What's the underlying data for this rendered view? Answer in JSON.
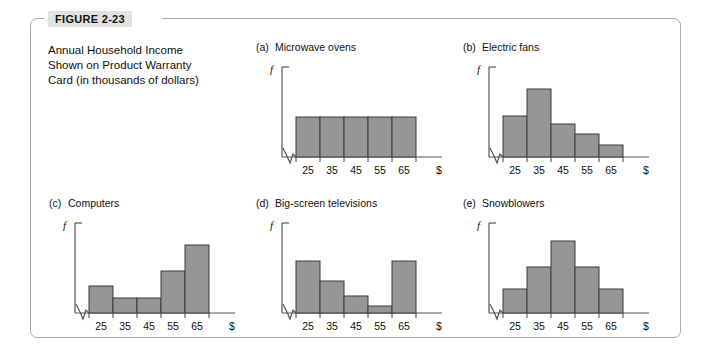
{
  "figure": {
    "tag": "FIGURE 2-23",
    "caption_lines": [
      "Annual Household Income",
      "Shown on Product Warranty",
      "Card (in thousands of dollars)"
    ]
  },
  "axis": {
    "y_label": "f",
    "x_label": "$",
    "tick_labels": [
      "25",
      "35",
      "45",
      "55",
      "65"
    ]
  },
  "colors": {
    "bar_fill": "#969696",
    "bar_stroke": "#3a3a3a",
    "axis": "#555555",
    "frame": "#a8a8a8",
    "tag_bg": "#e2e2e2"
  },
  "chart_data": [
    {
      "type": "bar",
      "title": "(a)  Microwave ovens",
      "label": "(a)",
      "name": "Microwave ovens",
      "shape": "uniform",
      "categories": [
        "25",
        "35",
        "45",
        "55",
        "65"
      ],
      "values": [
        44,
        44,
        44,
        44,
        44
      ],
      "xlabel": "$",
      "ylabel": "f",
      "ylim": [
        0,
        100
      ],
      "grid": false,
      "legend": "none",
      "axis_break": true
    },
    {
      "type": "bar",
      "title": "(b)  Electric fans",
      "label": "(b)",
      "name": "Electric fans",
      "shape": "skewed-right",
      "categories": [
        "25",
        "35",
        "45",
        "55",
        "65"
      ],
      "values": [
        46,
        75,
        37,
        25,
        13
      ],
      "xlabel": "$",
      "ylabel": "f",
      "ylim": [
        0,
        100
      ],
      "grid": false,
      "legend": "none",
      "axis_break": true
    },
    {
      "type": "bar",
      "title": "(c)  Computers",
      "label": "(c)",
      "name": "Computers",
      "shape": "skewed-left",
      "categories": [
        "25",
        "35",
        "45",
        "55",
        "65"
      ],
      "values": [
        30,
        17,
        17,
        47,
        76
      ],
      "xlabel": "$",
      "ylabel": "f",
      "ylim": [
        0,
        100
      ],
      "grid": false,
      "legend": "none",
      "axis_break": true
    },
    {
      "type": "bar",
      "title": "(d)  Big-screen televisions",
      "label": "(d)",
      "name": "Big-screen televisions",
      "shape": "bimodal-u",
      "categories": [
        "25",
        "35",
        "45",
        "55",
        "65"
      ],
      "values": [
        58,
        36,
        19,
        8,
        58
      ],
      "xlabel": "$",
      "ylabel": "f",
      "ylim": [
        0,
        100
      ],
      "grid": false,
      "legend": "none",
      "axis_break": true
    },
    {
      "type": "bar",
      "title": "(e)  Snowblowers",
      "label": "(e)",
      "name": "Snowblowers",
      "shape": "symmetric-bell",
      "categories": [
        "25",
        "35",
        "45",
        "55",
        "65"
      ],
      "values": [
        27,
        51,
        80,
        51,
        27
      ],
      "xlabel": "$",
      "ylabel": "f",
      "ylim": [
        0,
        100
      ],
      "grid": false,
      "legend": "none",
      "axis_break": true
    }
  ]
}
